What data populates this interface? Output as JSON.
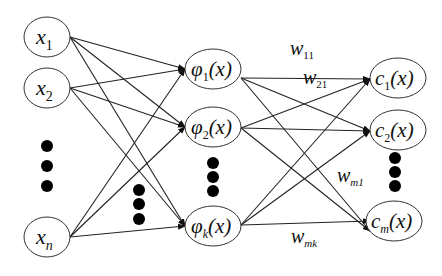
{
  "diagram": {
    "type": "rbf-neural-network",
    "input_nodes": [
      {
        "var": "x",
        "sub": "1"
      },
      {
        "var": "x",
        "sub": "2"
      },
      {
        "var": "x",
        "sub": "n"
      }
    ],
    "hidden_nodes": [
      {
        "var": "φ",
        "sub": "1",
        "arg": "(x)"
      },
      {
        "var": "φ",
        "sub": "2",
        "arg": "(x)"
      },
      {
        "var": "φ",
        "sub": "k",
        "arg": "(x)"
      }
    ],
    "output_nodes": [
      {
        "var": "c",
        "sub": "1",
        "arg": "(x)"
      },
      {
        "var": "c",
        "sub": "2",
        "arg": "(x)"
      },
      {
        "var": "c",
        "sub": "m",
        "arg": "(x)"
      }
    ],
    "weight_labels": [
      {
        "var": "w",
        "sub": "11"
      },
      {
        "var": "w",
        "sub": "21"
      },
      {
        "var": "w",
        "sub": "m1"
      },
      {
        "var": "w",
        "sub": "mk"
      }
    ],
    "ellipsis": "vertical-dots"
  }
}
